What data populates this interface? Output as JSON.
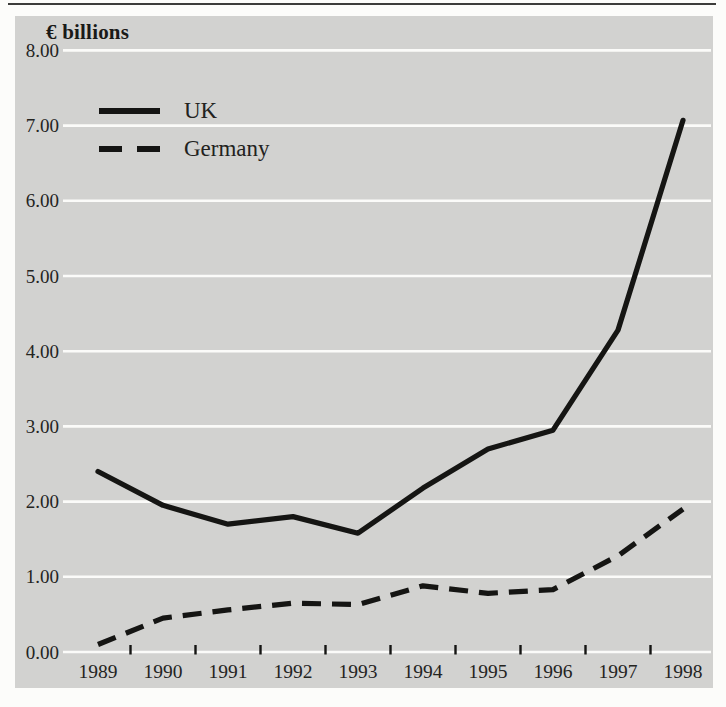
{
  "figure": {
    "unit_label": "€ billions",
    "colors": {
      "page_bg": "#fcfcfa",
      "panel_bg": "#d2d2d0",
      "gridline": "#fbfbf9",
      "line": "#151513",
      "text": "#24241f",
      "rule": "#3c3c3a"
    },
    "legend": [
      {
        "label": "UK",
        "style": "solid"
      },
      {
        "label": "Germany",
        "style": "dashed"
      }
    ]
  },
  "chart_data": {
    "type": "line",
    "title": "€ billions",
    "x": [
      1989,
      1990,
      1991,
      1992,
      1993,
      1994,
      1995,
      1996,
      1997,
      1998
    ],
    "x_labels": [
      "1989",
      "1990",
      "1991",
      "1992",
      "1993",
      "1994",
      "1995",
      "1996",
      "1997",
      "1998"
    ],
    "series": [
      {
        "name": "UK",
        "style": "solid",
        "values": [
          2.4,
          1.95,
          1.7,
          1.8,
          1.58,
          2.18,
          2.7,
          2.95,
          4.28,
          7.07
        ]
      },
      {
        "name": "Germany",
        "style": "dashed",
        "values": [
          0.1,
          0.45,
          0.56,
          0.65,
          0.63,
          0.88,
          0.78,
          0.83,
          1.28,
          1.9
        ]
      }
    ],
    "xlabel": "",
    "ylabel": "€ billions",
    "ylim": [
      0,
      8
    ],
    "ytick_step": 1,
    "ytick_labels": [
      "0.00",
      "1.00",
      "2.00",
      "3.00",
      "4.00",
      "5.00",
      "6.00",
      "7.00",
      "8.00"
    ],
    "grid": true,
    "legend_position": "top-left-inside"
  }
}
